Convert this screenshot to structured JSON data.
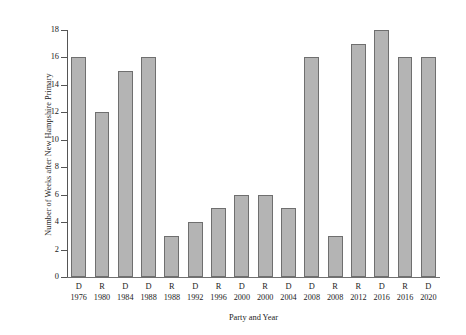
{
  "chart_data": {
    "type": "bar",
    "title": "",
    "xlabel": "Party and Year",
    "ylabel": "Number of Weeks after New Hampshire Primary",
    "categories": [
      "D 1976",
      "R 1980",
      "D 1984",
      "D 1988",
      "R 1988",
      "D 1992",
      "R 1996",
      "D 2000",
      "R 2000",
      "D 2004",
      "D 2008",
      "R 2008",
      "R 2012",
      "D 2016",
      "R 2016",
      "D 2020"
    ],
    "parties": [
      "D",
      "R",
      "D",
      "D",
      "R",
      "D",
      "R",
      "D",
      "R",
      "D",
      "D",
      "R",
      "R",
      "D",
      "R",
      "D"
    ],
    "years": [
      "1976",
      "1980",
      "1984",
      "1988",
      "1988",
      "1992",
      "1996",
      "2000",
      "2000",
      "2004",
      "2008",
      "2008",
      "2012",
      "2016",
      "2016",
      "2020"
    ],
    "values": [
      16,
      12,
      15,
      16,
      3,
      4,
      5,
      6,
      6,
      5,
      16,
      3,
      17,
      18,
      16,
      16
    ],
    "ylim": [
      0,
      18
    ],
    "yticks": [
      0,
      2,
      4,
      6,
      8,
      10,
      12,
      14,
      16,
      18
    ],
    "ytick_labels": [
      "0",
      "2",
      "4",
      "6",
      "8",
      "10",
      "12",
      "14",
      "16",
      "18"
    ],
    "grid": false,
    "legend": null,
    "bar_color": "#b4b4b4",
    "bar_edge_color": "#6f6f6f",
    "background_color": "#ffffff",
    "axis_color": "#555555"
  }
}
